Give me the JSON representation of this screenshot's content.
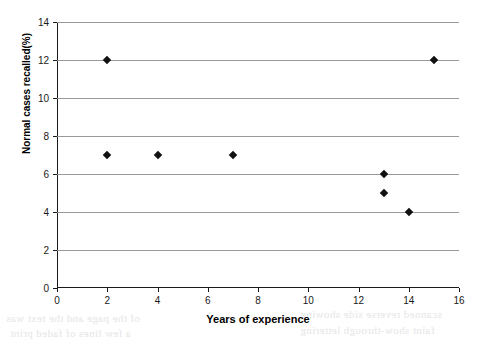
{
  "chart_data": {
    "type": "scatter",
    "title": "",
    "xlabel": "Years of experience",
    "ylabel": "Normal cases recalled(%)",
    "xlim": [
      0,
      16
    ],
    "ylim": [
      0,
      14
    ],
    "xticks": [
      0,
      2,
      4,
      6,
      8,
      10,
      12,
      14,
      16
    ],
    "yticks": [
      0,
      2,
      4,
      6,
      8,
      10,
      12,
      14
    ],
    "grid": "horizontal",
    "legend": "none",
    "marker": "diamond",
    "marker_color": "#111111",
    "gridline_color": "#9a9a9a",
    "axis_color": "#1a1a1a",
    "points": [
      {
        "x": 2,
        "y": 12
      },
      {
        "x": 2,
        "y": 7
      },
      {
        "x": 4,
        "y": 7
      },
      {
        "x": 7,
        "y": 7
      },
      {
        "x": 13,
        "y": 6
      },
      {
        "x": 13,
        "y": 5
      },
      {
        "x": 14,
        "y": 4
      },
      {
        "x": 15,
        "y": 12
      }
    ]
  },
  "artifacts": {
    "bleed_text": [
      "of the page and the text was",
      "a few lines of faded print",
      "scanned reverse side showing",
      "faint show-through lettering"
    ]
  }
}
